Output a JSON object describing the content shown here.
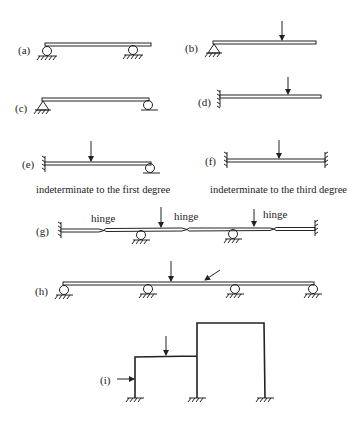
{
  "figure": {
    "panels": [
      {
        "id": "a",
        "label": "(a)",
        "description": "beam on two roller supports"
      },
      {
        "id": "b",
        "label": "(b)",
        "description": "beam with pin support at left, point load"
      },
      {
        "id": "c",
        "label": "(c)",
        "description": "simply supported beam: pin left, roller right"
      },
      {
        "id": "d",
        "label": "(d)",
        "description": "cantilever, fixed at left, point load"
      },
      {
        "id": "e",
        "label": "(e)",
        "description": "propped cantilever, point load",
        "caption": "indeterminate to the first degree"
      },
      {
        "id": "f",
        "label": "(f)",
        "description": "fixed-fixed beam, point load",
        "caption": "indeterminate to the third degree"
      },
      {
        "id": "g",
        "label": "(g)",
        "description": "fixed-fixed beam with three hinges and two roller supports, two point loads",
        "hinge_labels": [
          "hinge",
          "hinge",
          "hinge"
        ]
      },
      {
        "id": "h",
        "label": "(h)",
        "description": "continuous beam on four roller supports, vertical and inclined loads"
      },
      {
        "id": "i",
        "label": "(i)",
        "description": "two-bay stepped frame fixed at three bases, horizontal and vertical loads"
      }
    ]
  },
  "colors": {
    "ink": "#222222",
    "background": "#ffffff"
  }
}
